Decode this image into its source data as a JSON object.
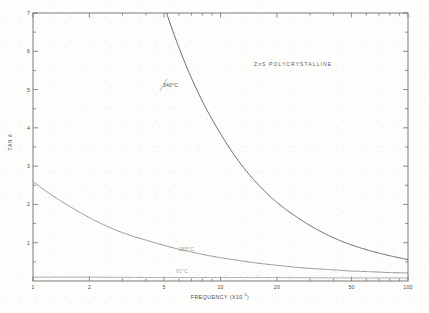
{
  "figure": {
    "annotation": "ZnS   POLYCRYSTALLINE"
  },
  "chart_data": {
    "type": "line",
    "title": "",
    "annotation": "ZnS   POLYCRYSTALLINE",
    "xlabel": "FREQUENCY  (X10",
    "xlabel_exponent": "-3",
    "xlabel_suffix": ")",
    "ylabel": "TAN δ",
    "xscale": "log",
    "yscale": "linear",
    "xlim": [
      1,
      100
    ],
    "ylim": [
      0,
      7
    ],
    "grid": false,
    "legend_position": "inline-curve-labels",
    "xticks": [
      1,
      2,
      5,
      10,
      20,
      50,
      100
    ],
    "xtick_labels": [
      "1",
      "2",
      "5",
      "10",
      "20",
      "50",
      "100"
    ],
    "yticks": [
      1,
      2,
      3,
      4,
      5,
      6,
      7
    ],
    "ytick_labels": [
      "1",
      "2",
      "3",
      "4",
      "5",
      "6",
      "7"
    ],
    "series": [
      {
        "name": "340°C",
        "label": "340°C",
        "color": "#5a5a5a",
        "x": [
          1,
          1.3,
          1.7,
          2.2,
          2.8,
          3.4,
          4,
          5,
          6,
          7,
          8.5,
          10,
          12,
          15,
          20,
          25,
          30,
          40,
          50,
          65,
          80,
          100
        ],
        "y": [
          31.0,
          24.5,
          19.5,
          15.4,
          12.3,
          10.3,
          8.9,
          7.2,
          6.1,
          5.3,
          4.45,
          3.85,
          3.25,
          2.65,
          2.05,
          1.7,
          1.45,
          1.13,
          0.94,
          0.77,
          0.66,
          0.56
        ]
      },
      {
        "name": "265°C",
        "label": "265°C",
        "color": "#8a8a8a",
        "x": [
          1,
          1.3,
          1.7,
          2.2,
          2.8,
          3.4,
          4,
          5,
          6,
          7,
          8.5,
          10,
          12,
          15,
          20,
          25,
          30,
          40,
          50,
          65,
          80,
          100
        ],
        "y": [
          2.6,
          2.2,
          1.85,
          1.55,
          1.32,
          1.17,
          1.07,
          0.93,
          0.83,
          0.76,
          0.67,
          0.61,
          0.55,
          0.48,
          0.41,
          0.36,
          0.33,
          0.29,
          0.26,
          0.24,
          0.22,
          0.21
        ]
      },
      {
        "name": "91°C",
        "label": "91°C",
        "color": "#9a9a9a",
        "x": [
          1,
          2,
          5,
          10,
          20,
          50,
          100
        ],
        "y": [
          0.1,
          0.1,
          0.09,
          0.09,
          0.09,
          0.08,
          0.08
        ]
      }
    ]
  },
  "curve_labels": {
    "c1": "340°C",
    "c2": "265°C",
    "c3": "91°C"
  }
}
